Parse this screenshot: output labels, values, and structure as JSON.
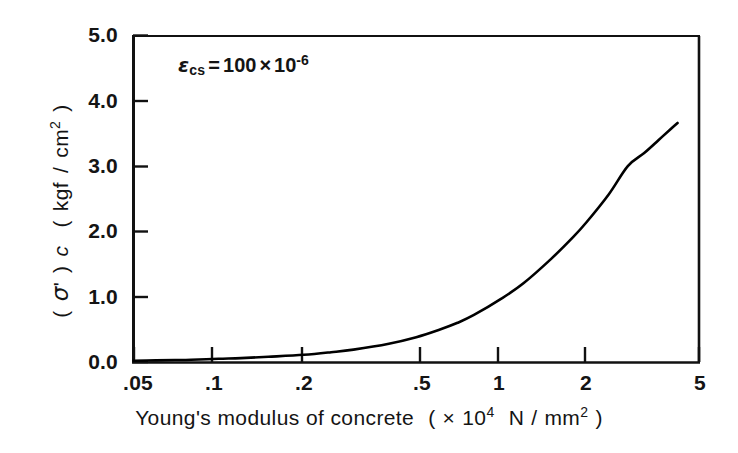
{
  "chart_data": {
    "type": "line",
    "title": "",
    "subtitle": "",
    "xlabel": "Young's modulus of concrete  ( × 10⁴ N / mm² )",
    "ylabel": "( σ' ) c  ( kgf / cm² )",
    "xscale": "log",
    "yscale": "linear",
    "xlim": [
      0.05,
      5
    ],
    "ylim": [
      0.0,
      5.0
    ],
    "grid": false,
    "legend": "none",
    "annotations": [
      {
        "text": "εcs = 100 × 10⁻⁶",
        "symbol": "ε",
        "subscript": "cs",
        "equals": "=",
        "mantissa": "100",
        "times": "×",
        "base": "10",
        "exponent": "-6",
        "x": 0.085,
        "y": 4.35
      }
    ],
    "xticks": [
      0.05,
      0.1,
      0.2,
      0.5,
      1,
      2,
      5
    ],
    "xticklabels": [
      ".05",
      ".1",
      ".2",
      ".5",
      "1",
      "2",
      "5"
    ],
    "yticks": [
      0.0,
      1.0,
      2.0,
      3.0,
      4.0,
      5.0
    ],
    "yticklabels": [
      "0.0",
      "1.0",
      "2.0",
      "3.0",
      "4.0",
      "5.0"
    ],
    "series": [
      {
        "name": "shrinkage stress vs Young's modulus",
        "color": "#000000",
        "linewidth": 2,
        "x": [
          0.05,
          0.06,
          0.07,
          0.08,
          0.1,
          0.12,
          0.15,
          0.2,
          0.25,
          0.3,
          0.4,
          0.5,
          0.6,
          0.7,
          0.8,
          1.0,
          1.2,
          1.5,
          1.8,
          2.0,
          2.4,
          2.8,
          3.2,
          3.6,
          4.0,
          4.2
        ],
        "y": [
          0.02,
          0.025,
          0.03,
          0.035,
          0.05,
          0.06,
          0.08,
          0.11,
          0.15,
          0.19,
          0.28,
          0.38,
          0.49,
          0.6,
          0.72,
          0.97,
          1.21,
          1.58,
          1.92,
          2.14,
          2.57,
          3.0,
          3.2,
          3.4,
          3.58,
          3.66
        ]
      }
    ]
  },
  "axis_title_parts": {
    "x_main": "Young's modulus of concrete",
    "x_paren_open": "(",
    "x_times": "×",
    "x_base": "10",
    "x_exp": "4",
    "x_unit_num": "N",
    "x_unit_slash": "/",
    "x_unit_den": "mm",
    "x_unit_den_exp": "2",
    "x_paren_close": ")",
    "y_paren_open": "(",
    "y_sigma": "σ",
    "y_prime": "'",
    "y_paren_close": ")",
    "y_sub_c": "c",
    "y_unit_paren_open": "(",
    "y_unit_num": "kgf",
    "y_unit_slash": "/",
    "y_unit_den": "cm",
    "y_unit_den_exp": "2",
    "y_unit_paren_close": ")"
  },
  "colors": {
    "curve": "#000000",
    "axis": "#111111",
    "text": "#141414",
    "background": "#ffffff"
  }
}
